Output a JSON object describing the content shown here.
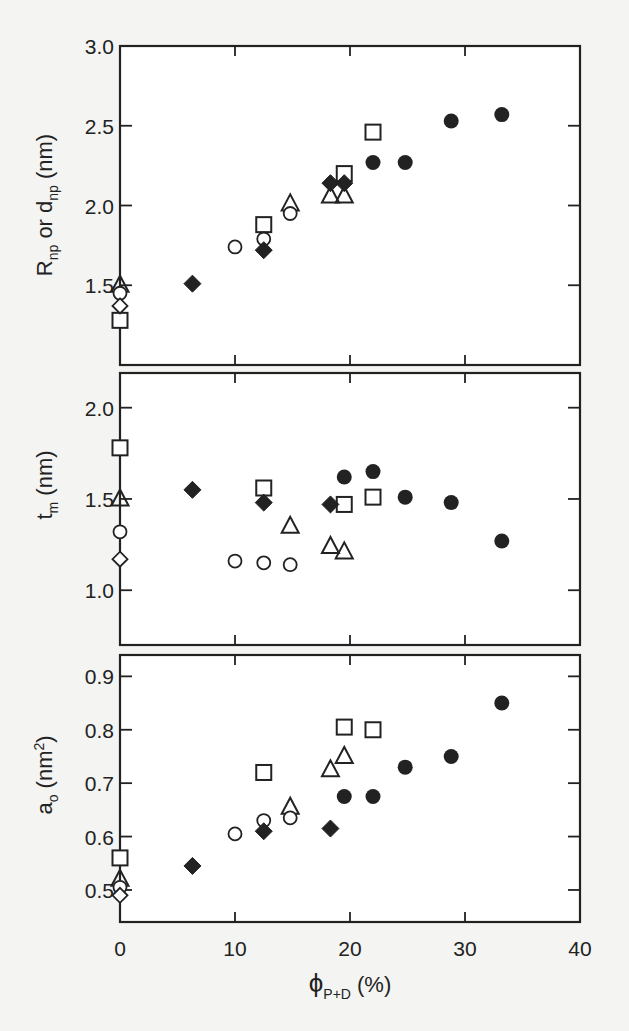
{
  "chart_data": [
    {
      "type": "scatter",
      "panel": "top",
      "ylabel": "R_np or d_np (nm)",
      "ylabel_main": "R",
      "ylabel_sub1": "np",
      "ylabel_mid": " or d",
      "ylabel_sub2": "np",
      "ylabel_unit": " (nm)",
      "xlim": [
        0,
        40
      ],
      "ylim": [
        1.0,
        3.0
      ],
      "yticks": [
        1.5,
        2.0,
        2.5,
        3.0
      ],
      "ytick_labels": [
        "1.5",
        "2.0",
        "2.5",
        "3.0"
      ],
      "series": [
        {
          "name": "open-square",
          "marker": "square-open",
          "points": [
            [
              0,
              1.28
            ],
            [
              12.5,
              1.88
            ],
            [
              19.5,
              2.2
            ],
            [
              22,
              2.46
            ]
          ]
        },
        {
          "name": "open-triangle",
          "marker": "triangle-open",
          "points": [
            [
              0,
              1.5
            ],
            [
              14.8,
              2.01
            ],
            [
              18.3,
              2.06
            ],
            [
              19.5,
              2.06
            ]
          ]
        },
        {
          "name": "open-circle",
          "marker": "circle-open",
          "points": [
            [
              0,
              1.45
            ],
            [
              10,
              1.74
            ],
            [
              12.5,
              1.79
            ],
            [
              14.8,
              1.95
            ]
          ]
        },
        {
          "name": "open-diamond",
          "marker": "diamond-open",
          "points": [
            [
              0,
              1.37
            ]
          ]
        },
        {
          "name": "filled-diamond",
          "marker": "diamond-filled",
          "points": [
            [
              6.3,
              1.51
            ],
            [
              12.5,
              1.72
            ],
            [
              18.3,
              2.14
            ],
            [
              19.5,
              2.14
            ]
          ]
        },
        {
          "name": "filled-circle",
          "marker": "circle-filled",
          "points": [
            [
              22,
              2.27
            ],
            [
              24.8,
              2.27
            ],
            [
              28.8,
              2.53
            ],
            [
              33.2,
              2.57
            ]
          ]
        }
      ]
    },
    {
      "type": "scatter",
      "panel": "middle",
      "ylabel": "t_m (nm)",
      "ylabel_main": "t",
      "ylabel_sub1": "m",
      "ylabel_unit": " (nm)",
      "xlim": [
        0,
        40
      ],
      "ylim": [
        0.7,
        2.19
      ],
      "yticks": [
        1.0,
        1.5,
        2.0
      ],
      "ytick_labels": [
        "1.0",
        "1.5",
        "2.0"
      ],
      "series": [
        {
          "name": "open-square",
          "marker": "square-open",
          "points": [
            [
              0,
              1.78
            ],
            [
              12.5,
              1.56
            ],
            [
              19.5,
              1.47
            ],
            [
              22,
              1.51
            ]
          ]
        },
        {
          "name": "open-triangle",
          "marker": "triangle-open",
          "points": [
            [
              0,
              1.5
            ],
            [
              14.8,
              1.35
            ],
            [
              18.3,
              1.24
            ],
            [
              19.5,
              1.21
            ]
          ]
        },
        {
          "name": "open-circle",
          "marker": "circle-open",
          "points": [
            [
              0,
              1.32
            ],
            [
              10,
              1.16
            ],
            [
              12.5,
              1.15
            ],
            [
              14.8,
              1.14
            ]
          ]
        },
        {
          "name": "open-diamond",
          "marker": "diamond-open",
          "points": [
            [
              0,
              1.17
            ]
          ]
        },
        {
          "name": "filled-diamond",
          "marker": "diamond-filled",
          "points": [
            [
              6.3,
              1.55
            ],
            [
              12.5,
              1.48
            ],
            [
              18.3,
              1.47
            ]
          ]
        },
        {
          "name": "filled-circle",
          "marker": "circle-filled",
          "points": [
            [
              19.5,
              1.62
            ],
            [
              22,
              1.65
            ],
            [
              24.8,
              1.51
            ],
            [
              28.8,
              1.48
            ],
            [
              33.2,
              1.27
            ]
          ]
        }
      ]
    },
    {
      "type": "scatter",
      "panel": "bottom",
      "ylabel": "a_o (nm^2)",
      "ylabel_main": "a",
      "ylabel_sub1": "o",
      "ylabel_unit": " (nm",
      "ylabel_sup": "2",
      "ylabel_close": ")",
      "xlabel": "ϕ_P+D (%)",
      "xlabel_main": "ϕ",
      "xlabel_sub": "P+D",
      "xlabel_unit": " (%)",
      "xlim": [
        0,
        40
      ],
      "ylim": [
        0.44,
        0.94
      ],
      "xticks": [
        0,
        10,
        20,
        30,
        40
      ],
      "xtick_labels": [
        "0",
        "10",
        "20",
        "30",
        "40"
      ],
      "yticks": [
        0.5,
        0.6,
        0.7,
        0.8,
        0.9
      ],
      "ytick_labels": [
        "0.5",
        "0.6",
        "0.7",
        "0.8",
        "0.9"
      ],
      "series": [
        {
          "name": "open-square",
          "marker": "square-open",
          "points": [
            [
              0,
              0.56
            ],
            [
              12.5,
              0.72
            ],
            [
              19.5,
              0.805
            ],
            [
              22,
              0.8
            ]
          ]
        },
        {
          "name": "open-triangle",
          "marker": "triangle-open",
          "points": [
            [
              0,
              0.52
            ],
            [
              14.8,
              0.655
            ],
            [
              18.3,
              0.725
            ],
            [
              19.5,
              0.75
            ]
          ]
        },
        {
          "name": "open-circle",
          "marker": "circle-open",
          "points": [
            [
              0,
              0.505
            ],
            [
              10,
              0.605
            ],
            [
              12.5,
              0.63
            ],
            [
              14.8,
              0.635
            ]
          ]
        },
        {
          "name": "open-diamond",
          "marker": "diamond-open",
          "points": [
            [
              0,
              0.49
            ]
          ]
        },
        {
          "name": "filled-diamond",
          "marker": "diamond-filled",
          "points": [
            [
              6.3,
              0.545
            ],
            [
              12.5,
              0.61
            ],
            [
              18.3,
              0.615
            ]
          ]
        },
        {
          "name": "filled-circle",
          "marker": "circle-filled",
          "points": [
            [
              19.5,
              0.675
            ],
            [
              22,
              0.675
            ],
            [
              24.8,
              0.73
            ],
            [
              28.8,
              0.75
            ],
            [
              33.2,
              0.85
            ]
          ]
        }
      ]
    }
  ],
  "layout": {
    "plot_left": 120,
    "plot_right": 580,
    "panels": [
      {
        "top": 46,
        "bottom": 365
      },
      {
        "top": 373,
        "bottom": 645
      },
      {
        "top": 655,
        "bottom": 922
      }
    ],
    "grid": false,
    "legend": "none",
    "colors": {
      "ink": "#222222",
      "background": "#f4f4f2",
      "plot_bg": "#ffffff"
    }
  }
}
